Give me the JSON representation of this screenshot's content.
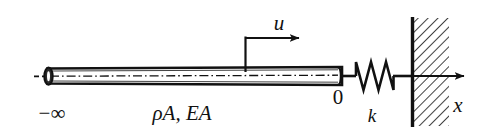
{
  "figure": {
    "width": 492,
    "height": 134,
    "background_color": "#ffffff",
    "ink_color": "#111111"
  },
  "labels": {
    "displacement": "u",
    "axis": "x",
    "spring_stiffness": "k",
    "origin": "0",
    "left_end": "−∞",
    "bar_properties": "ρA,  EA"
  },
  "elements": {
    "bar": {
      "name": "elastic-bar",
      "left_x": 45,
      "right_x": 342,
      "center_y": 76,
      "thickness": 16,
      "centerline_style": "dash-dot",
      "left_cap": "filled-ellipse",
      "description": "Long slender uniform bar drawn as a thin rectangle with a dash-dot axis line"
    },
    "spring": {
      "name": "coil-spring",
      "start_x": 355,
      "end_x": 400,
      "center_y": 76,
      "peaks": 3,
      "amplitude": 15,
      "description": "Zigzag spring connecting bar end to rigid wall"
    },
    "wall": {
      "name": "rigid-wall",
      "face_x": 412,
      "top_y": 18,
      "bottom_y": 126,
      "hatch_width": 36,
      "hatch_angle_deg": 45,
      "description": "Fixed support shown as a thick vertical line with 45-degree hatching on its right"
    },
    "displacement_arrow": {
      "name": "displacement-arrow-u",
      "from_x": 245,
      "to_x": 303,
      "y": 38,
      "tick_from_y": 38,
      "tick_to_y": 70,
      "direction": "right"
    },
    "axis_arrow": {
      "name": "x-axis-arrow",
      "from_x": 400,
      "to_x": 468,
      "y": 76,
      "direction": "right"
    }
  }
}
